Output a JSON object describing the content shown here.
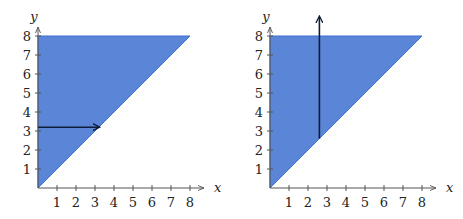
{
  "colors": {
    "region_fill": "#5b86d8",
    "region_edge": "#3f6fcf",
    "axis": "#555555",
    "arrow": "#0f1d3a",
    "background": "#ffffff"
  },
  "chart_data": [
    {
      "type": "area",
      "title": "",
      "xlabel": "x",
      "ylabel": "y",
      "xlim": [
        0,
        8
      ],
      "ylim": [
        0,
        8
      ],
      "x_ticks": [
        "1",
        "2",
        "3",
        "4",
        "5",
        "6",
        "7",
        "8"
      ],
      "y_ticks": [
        "1",
        "2",
        "3",
        "4",
        "5",
        "6",
        "7",
        "8"
      ],
      "region": {
        "description": "triangle bounded by x=0, y=8 and y=x",
        "vertices": [
          [
            0,
            0
          ],
          [
            0,
            8
          ],
          [
            8,
            8
          ]
        ]
      },
      "arrow": {
        "direction": "horizontal",
        "from": [
          0,
          3.2
        ],
        "to": [
          3.2,
          3.2
        ]
      },
      "grid": false
    },
    {
      "type": "area",
      "title": "",
      "xlabel": "x",
      "ylabel": "y",
      "xlim": [
        0,
        8
      ],
      "ylim": [
        0,
        8
      ],
      "x_ticks": [
        "1",
        "2",
        "3",
        "4",
        "5",
        "6",
        "7",
        "8"
      ],
      "y_ticks": [
        "1",
        "2",
        "3",
        "4",
        "5",
        "6",
        "7",
        "8"
      ],
      "region": {
        "description": "triangle bounded by x=0, y=8 and y=x",
        "vertices": [
          [
            0,
            0
          ],
          [
            0,
            8
          ],
          [
            8,
            8
          ]
        ]
      },
      "arrow": {
        "direction": "vertical",
        "from": [
          2.6,
          2.6
        ],
        "to": [
          2.6,
          9.0
        ]
      },
      "grid": false
    }
  ],
  "plots": [
    {
      "x_label": "x",
      "y_label": "y",
      "x_tick_labels": [
        "1",
        "2",
        "3",
        "4",
        "5",
        "6",
        "7",
        "8"
      ],
      "y_tick_labels": [
        "1",
        "2",
        "3",
        "4",
        "5",
        "6",
        "7",
        "8"
      ]
    },
    {
      "x_label": "x",
      "y_label": "y",
      "x_tick_labels": [
        "1",
        "2",
        "3",
        "4",
        "5",
        "6",
        "7",
        "8"
      ],
      "y_tick_labels": [
        "1",
        "2",
        "3",
        "4",
        "5",
        "6",
        "7",
        "8"
      ]
    }
  ]
}
